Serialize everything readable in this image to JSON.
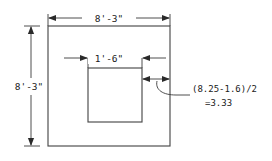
{
  "diagram": {
    "background_color": "#ffffff",
    "line_color": "#4a4a4a",
    "text_color": "#1a1a1a",
    "dimensions": {
      "top_width_label": "8'-3\"",
      "left_height_label": "8'-3\"",
      "inner_width_label": "1'-6\"",
      "edge_note_line1": "(8.25-1.6)/2",
      "edge_note_line2": "=3.33"
    },
    "shapes": {
      "outer_square_name": "outer-square",
      "inner_square_name": "inner-square"
    }
  }
}
